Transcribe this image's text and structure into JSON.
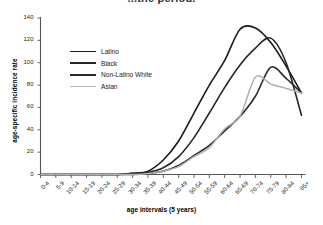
{
  "chart_data": {
    "type": "line",
    "title": "...the period.",
    "xlabel": "age intervals (5 years)",
    "ylabel": "age-specific incidence rate",
    "categories": [
      "0-4",
      "5-9",
      "10-14",
      "15-19",
      "20-24",
      "25-29",
      "30-34",
      "35-39",
      "40-44",
      "45-49",
      "50-54",
      "55-59",
      "60-64",
      "65-69",
      "70-74",
      "75-79",
      "80-84",
      "85+"
    ],
    "ylim": [
      0,
      140
    ],
    "yticks": [
      0,
      20,
      40,
      60,
      80,
      100,
      120,
      140
    ],
    "grid": false,
    "legend_position": "upper-left-inside",
    "series": [
      {
        "name": "Latino",
        "color": "#1a1a1a",
        "width": 1.6,
        "values": [
          0,
          0,
          0,
          0,
          0,
          0,
          1,
          3,
          13,
          30,
          55,
          80,
          102,
          130,
          131,
          118,
          97,
          73
        ]
      },
      {
        "name": "Black",
        "color": "#262626",
        "width": 1.6,
        "values": [
          0,
          0,
          0,
          0,
          0,
          0,
          1,
          2,
          6,
          16,
          33,
          55,
          78,
          98,
          113,
          122,
          100,
          53
        ]
      },
      {
        "name": "Non-Latino White",
        "color": "#2b2b2b",
        "width": 1.6,
        "values": [
          0,
          0,
          0,
          0,
          0,
          0,
          0,
          1,
          3,
          8,
          17,
          26,
          39,
          52,
          70,
          96,
          86,
          73
        ]
      },
      {
        "name": "Asian",
        "color": "#b0b0b0",
        "width": 1.5,
        "values": [
          0,
          0,
          0,
          0,
          0,
          0,
          0,
          1,
          3,
          7,
          16,
          24,
          41,
          52,
          87,
          81,
          77,
          73
        ]
      }
    ]
  },
  "axes": {
    "y_tick_labels": [
      "0",
      "20",
      "40",
      "60",
      "80",
      "100",
      "120",
      "140"
    ],
    "x_tick_labels": [
      "0-4",
      "5-9",
      "10-14",
      "15-19",
      "20-24",
      "25-29",
      "30-34",
      "35-39",
      "40-44",
      "45-49",
      "50-54",
      "55-59",
      "60-64",
      "65-69",
      "70-74",
      "75-79",
      "80-84",
      "85+"
    ]
  },
  "legend": {
    "items": [
      {
        "label": "Latino",
        "color": "#1a1a1a",
        "width": "1.9px"
      },
      {
        "label": "Black",
        "color": "#262626",
        "width": "2.1px"
      },
      {
        "label": "Non-Latino White",
        "color": "#2b2b2b",
        "width": "2.1px"
      },
      {
        "label": "Asian",
        "color": "#b7b7b7",
        "width": "1.6px"
      }
    ]
  }
}
